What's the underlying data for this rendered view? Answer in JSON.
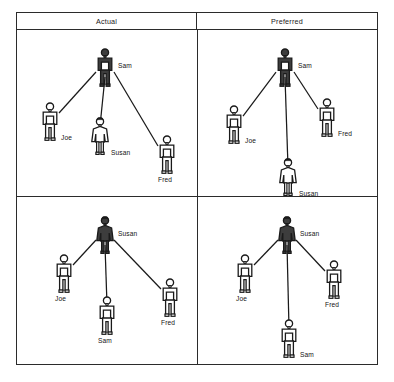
{
  "figure": {
    "type": "sociogram-grid",
    "columns": [
      "Actual",
      "Preferred"
    ],
    "highlight_color": "#3d3d3d",
    "outline_color": "#1a1a1a",
    "border_color": "#2b2b2b"
  },
  "header": {
    "left_label": "Actual",
    "right_label": "Preferred"
  },
  "panels": {
    "top_left": {
      "id": "actual-sam",
      "center": "Sam",
      "nodes": [
        {
          "name": "Sam",
          "gender": "male",
          "shaded": true,
          "x": 88,
          "y": 38,
          "label_pos": "right"
        },
        {
          "name": "Joe",
          "gender": "male",
          "shaded": false,
          "x": 33,
          "y": 92,
          "label_pos": "br"
        },
        {
          "name": "Susan",
          "gender": "female",
          "shaded": false,
          "x": 83,
          "y": 107,
          "label_pos": "br"
        },
        {
          "name": "Fred",
          "gender": "male",
          "shaded": false,
          "x": 150,
          "y": 125,
          "label_pos": "below"
        }
      ],
      "edges": [
        {
          "from": "Sam",
          "to": "Joe"
        },
        {
          "from": "Sam",
          "to": "Susan"
        },
        {
          "from": "Sam",
          "to": "Fred"
        }
      ]
    },
    "top_right": {
      "id": "preferred-sam",
      "center": "Sam",
      "nodes": [
        {
          "name": "Sam",
          "gender": "male",
          "shaded": true,
          "x": 88,
          "y": 38,
          "label_pos": "right"
        },
        {
          "name": "Joe",
          "gender": "male",
          "shaded": false,
          "x": 37,
          "y": 95,
          "label_pos": "br"
        },
        {
          "name": "Fred",
          "gender": "male",
          "shaded": false,
          "x": 130,
          "y": 88,
          "label_pos": "br"
        },
        {
          "name": "Susan",
          "gender": "female",
          "shaded": false,
          "x": 91,
          "y": 148,
          "label_pos": "br"
        }
      ],
      "edges": [
        {
          "from": "Sam",
          "to": "Joe"
        },
        {
          "from": "Sam",
          "to": "Fred"
        },
        {
          "from": "Sam",
          "to": "Susan"
        }
      ]
    },
    "bottom_left": {
      "id": "actual-susan",
      "center": "Susan",
      "nodes": [
        {
          "name": "Susan",
          "gender": "female",
          "shaded": true,
          "x": 88,
          "y": 40,
          "label_pos": "right"
        },
        {
          "name": "Joe",
          "gender": "male",
          "shaded": false,
          "x": 47,
          "y": 78,
          "label_pos": "below"
        },
        {
          "name": "Sam",
          "gender": "male",
          "shaded": false,
          "x": 90,
          "y": 120,
          "label_pos": "below"
        },
        {
          "name": "Fred",
          "gender": "male",
          "shaded": false,
          "x": 153,
          "y": 102,
          "label_pos": "below"
        }
      ],
      "edges": [
        {
          "from": "Susan",
          "to": "Joe"
        },
        {
          "from": "Susan",
          "to": "Sam"
        },
        {
          "from": "Susan",
          "to": "Fred"
        }
      ]
    },
    "bottom_right": {
      "id": "preferred-susan",
      "center": "Susan",
      "nodes": [
        {
          "name": "Susan",
          "gender": "female",
          "shaded": true,
          "x": 90,
          "y": 40,
          "label_pos": "right"
        },
        {
          "name": "Joe",
          "gender": "male",
          "shaded": false,
          "x": 48,
          "y": 78,
          "label_pos": "below"
        },
        {
          "name": "Fred",
          "gender": "male",
          "shaded": false,
          "x": 137,
          "y": 84,
          "label_pos": "below"
        },
        {
          "name": "Sam",
          "gender": "male",
          "shaded": false,
          "x": 92,
          "y": 143,
          "label_pos": "br"
        }
      ],
      "edges": [
        {
          "from": "Susan",
          "to": "Joe"
        },
        {
          "from": "Susan",
          "to": "Fred"
        },
        {
          "from": "Susan",
          "to": "Sam"
        }
      ]
    }
  }
}
